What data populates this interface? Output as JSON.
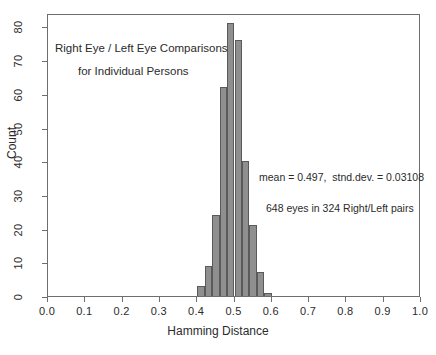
{
  "chart_data": {
    "type": "bar",
    "title": "",
    "subtitle": "",
    "xlabel": "Hamming Distance",
    "ylabel": "Count",
    "xlim": [
      0.0,
      1.0
    ],
    "ylim": [
      0,
      84
    ],
    "grid": false,
    "legend": null,
    "bin_width": 0.02,
    "categories": [
      0.41,
      0.43,
      0.45,
      0.47,
      0.49,
      0.51,
      0.53,
      0.55,
      0.57,
      0.59
    ],
    "bin_edges": [
      0.4,
      0.42,
      0.44,
      0.46,
      0.48,
      0.5,
      0.52,
      0.54,
      0.56,
      0.58,
      0.6
    ],
    "values": [
      3,
      9,
      24,
      62,
      81,
      76,
      40,
      21,
      7,
      1
    ],
    "xticks": [
      "0.0",
      "0.1",
      "0.2",
      "0.3",
      "0.4",
      "0.5",
      "0.6",
      "0.7",
      "0.8",
      "0.9",
      "1.0"
    ],
    "xtick_values": [
      0.0,
      0.1,
      0.2,
      0.3,
      0.4,
      0.5,
      0.6,
      0.7,
      0.8,
      0.9,
      1.0
    ],
    "yticks": [
      "0",
      "10",
      "20",
      "30",
      "40",
      "50",
      "60",
      "70",
      "80"
    ],
    "ytick_values": [
      0,
      10,
      20,
      30,
      40,
      50,
      60,
      70,
      80
    ],
    "annotations": [
      "Right Eye / Left Eye Comparisons",
      "for Individual Persons",
      "mean = 0.497,  stnd.dev. = 0.03108",
      "648 eyes in 324 Right/Left pairs"
    ],
    "bar_color": "#8f8f8f",
    "bar_edge_color": "#5a5a5a",
    "axis_color": "#6e6e6e",
    "text_color": "#2b2b2b"
  },
  "labels": {
    "xaxis_title": "Hamming Distance",
    "yaxis_title": "Count",
    "annotation_line1": "Right Eye / Left Eye Comparisons",
    "annotation_line2": "for Individual Persons",
    "annotation_stats": "mean = 0.497,  stnd.dev. = 0.03108",
    "annotation_count": "648 eyes in 324 Right/Left pairs"
  }
}
